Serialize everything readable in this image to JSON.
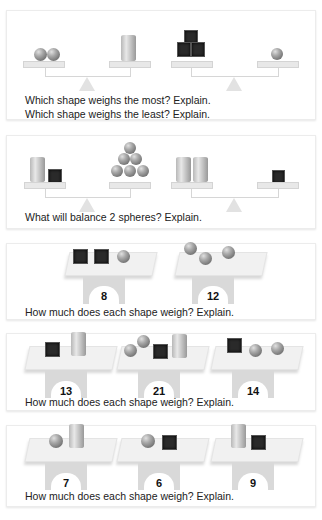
{
  "problems": [
    {
      "id": 1,
      "questions": [
        "Which shape weighs the most? Explain.",
        "Which shape weighs the least? Explain."
      ],
      "balances": [
        {
          "left": [
            "sphere",
            "sphere"
          ],
          "right": [
            "cylinder"
          ]
        },
        {
          "left": [
            "cube",
            "cube",
            "cube"
          ],
          "right": [
            "sphere"
          ]
        }
      ]
    },
    {
      "id": 2,
      "questions": [
        "What will balance 2 spheres? Explain."
      ],
      "balances": [
        {
          "left": [
            "cylinder",
            "cube"
          ],
          "right": [
            "sphere",
            "sphere",
            "sphere",
            "sphere",
            "sphere",
            "sphere"
          ]
        },
        {
          "left": [
            "cylinder",
            "cylinder"
          ],
          "right": [
            "cube"
          ]
        }
      ]
    },
    {
      "id": 3,
      "questions": [
        "How much does each shape weigh? Explain."
      ],
      "scales": [
        {
          "items": [
            "cube",
            "cube",
            "sphere"
          ],
          "reading": "8"
        },
        {
          "items": [
            "sphere",
            "sphere",
            "sphere"
          ],
          "reading": "12"
        }
      ]
    },
    {
      "id": 4,
      "questions": [
        "How much does each shape weigh? Explain."
      ],
      "scales": [
        {
          "items": [
            "cube",
            "cylinder"
          ],
          "reading": "13"
        },
        {
          "items": [
            "sphere",
            "sphere",
            "cube",
            "cylinder"
          ],
          "reading": "21"
        },
        {
          "items": [
            "cube",
            "sphere",
            "sphere"
          ],
          "reading": "14"
        }
      ]
    },
    {
      "id": 5,
      "questions": [
        "How much does each shape weigh? Explain."
      ],
      "scales": [
        {
          "items": [
            "sphere",
            "cylinder"
          ],
          "reading": "7"
        },
        {
          "items": [
            "sphere",
            "cube"
          ],
          "reading": "6"
        },
        {
          "items": [
            "cylinder",
            "cube"
          ],
          "reading": "9"
        }
      ]
    }
  ]
}
